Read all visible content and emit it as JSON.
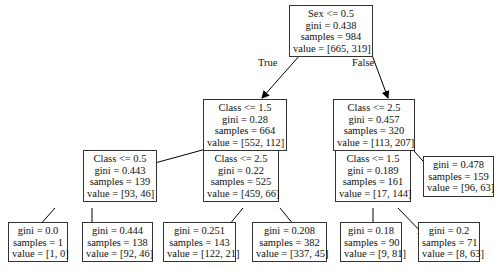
{
  "tree": {
    "edge_labels": {
      "true": "True",
      "false": "False"
    },
    "nodes": [
      {
        "id": "n0",
        "split": "Sex <= 0.5",
        "gini": "gini = 0.438",
        "samples": "samples = 984",
        "value": "value = [665, 319]"
      },
      {
        "id": "n1",
        "split": "Class <= 1.5",
        "gini": "gini = 0.28",
        "samples": "samples = 664",
        "value": "value = [552, 112]"
      },
      {
        "id": "n2",
        "split": "Class <= 2.5",
        "gini": "gini = 0.457",
        "samples": "samples = 320",
        "value": "value = [113, 207]"
      },
      {
        "id": "n3",
        "split": "Class <= 0.5",
        "gini": "gini = 0.443",
        "samples": "samples = 139",
        "value": "value = [93, 46]"
      },
      {
        "id": "n4",
        "split": "Class <= 2.5",
        "gini": "gini = 0.22",
        "samples": "samples = 525",
        "value": "value = [459, 66]"
      },
      {
        "id": "n5",
        "split": "Class <= 1.5",
        "gini": "gini = 0.189",
        "samples": "samples = 161",
        "value": "value = [17, 144]"
      },
      {
        "id": "n6",
        "gini": "gini = 0.478",
        "samples": "samples = 159",
        "value": "value = [96, 63]"
      },
      {
        "id": "n7",
        "gini": "gini = 0.0",
        "samples": "samples = 1",
        "value": "value = [1, 0]"
      },
      {
        "id": "n8",
        "gini": "gini = 0.444",
        "samples": "samples = 138",
        "value": "value = [92, 46]"
      },
      {
        "id": "n9",
        "gini": "gini = 0.251",
        "samples": "samples = 143",
        "value": "value = [122, 21]"
      },
      {
        "id": "n10",
        "gini": "gini = 0.208",
        "samples": "samples = 382",
        "value": "value = [337, 45]"
      },
      {
        "id": "n11",
        "gini": "gini = 0.18",
        "samples": "samples = 90",
        "value": "value = [9, 81]"
      },
      {
        "id": "n12",
        "gini": "gini = 0.2",
        "samples": "samples = 71",
        "value": "value = [8, 63]"
      }
    ]
  }
}
